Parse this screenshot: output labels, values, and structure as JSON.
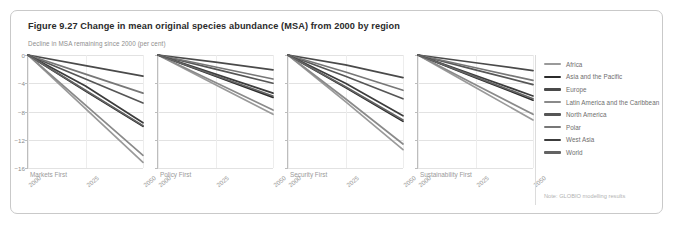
{
  "figure": {
    "title": "Figure 9.27 Change in mean original species abundance (MSA) from 2000 by region",
    "subtitle": "Decline in MSA remaining since 2000 (per cent)",
    "note": "Note: GLOBIO modelling results"
  },
  "legend": {
    "position": "right",
    "items": [
      {
        "label": "Africa",
        "color": "#9a9a9a"
      },
      {
        "label": "Asia and the Pacific",
        "color": "#2b2b2b"
      },
      {
        "label": "Europe",
        "color": "#4a4a4a"
      },
      {
        "label": "Latin America and the Caribbean",
        "color": "#8a8a8a"
      },
      {
        "label": "North America",
        "color": "#565656"
      },
      {
        "label": "Polar",
        "color": "#777777"
      },
      {
        "label": "West Asia",
        "color": "#3c3c3c"
      },
      {
        "label": "World",
        "color": "#636363"
      }
    ]
  },
  "axes": {
    "ylabel": "Decline in MSA remaining since 2000 (per cent)",
    "yticks": [
      0,
      -4,
      -8,
      -12,
      -16
    ],
    "ylim": [
      -16,
      0
    ],
    "xticks": [
      "2000",
      "2025",
      "2050"
    ],
    "xlim": [
      2000,
      2050
    ],
    "grid": true
  },
  "chart_data": {
    "type": "line",
    "title": "Figure 9.27 Change in mean original species abundance (MSA) from 2000 by region",
    "xlabel": "",
    "ylabel": "Decline in MSA remaining since 2000 (per cent)",
    "ylim": [
      -16,
      0
    ],
    "yticks": [
      0,
      -4,
      -8,
      -12,
      -16
    ],
    "x": [
      2000,
      2025,
      2050
    ],
    "xtick_labels": [
      "2000",
      "2025",
      "2050"
    ],
    "legend_position": "right",
    "note": "Note: GLOBIO modelling results",
    "panels": [
      {
        "label": "Markets First",
        "series": [
          {
            "name": "Africa",
            "color": "#9a9a9a",
            "values": [
              0,
              -7.6,
              -15.2
            ]
          },
          {
            "name": "Asia and the Pacific",
            "color": "#2b2b2b",
            "values": [
              0,
              -5.1,
              -10.1
            ]
          },
          {
            "name": "Europe",
            "color": "#4a4a4a",
            "values": [
              0,
              -1.5,
              -3.0
            ]
          },
          {
            "name": "Latin America and the Caribbean",
            "color": "#8a8a8a",
            "values": [
              0,
              -7.1,
              -14.2
            ]
          },
          {
            "name": "North America",
            "color": "#565656",
            "values": [
              0,
              -3.4,
              -6.8
            ]
          },
          {
            "name": "Polar",
            "color": "#777777",
            "values": [
              0,
              -2.7,
              -5.4
            ]
          },
          {
            "name": "West Asia",
            "color": "#3c3c3c",
            "values": [
              0,
              -4.4,
              -9.6
            ]
          },
          {
            "name": "World",
            "color": "#636363",
            "values": [
              0,
              -5.0,
              -10.0
            ]
          }
        ]
      },
      {
        "label": "Policy First",
        "series": [
          {
            "name": "Africa",
            "color": "#9a9a9a",
            "values": [
              0,
              -4.2,
              -8.4
            ]
          },
          {
            "name": "Asia and the Pacific",
            "color": "#2b2b2b",
            "values": [
              0,
              -3.0,
              -6.0
            ]
          },
          {
            "name": "Europe",
            "color": "#4a4a4a",
            "values": [
              0,
              -1.0,
              -2.1
            ]
          },
          {
            "name": "Latin America and the Caribbean",
            "color": "#8a8a8a",
            "values": [
              0,
              -3.9,
              -7.8
            ]
          },
          {
            "name": "North America",
            "color": "#565656",
            "values": [
              0,
              -2.0,
              -4.0
            ]
          },
          {
            "name": "Polar",
            "color": "#777777",
            "values": [
              0,
              -1.7,
              -3.4
            ]
          },
          {
            "name": "West Asia",
            "color": "#3c3c3c",
            "values": [
              0,
              -2.7,
              -5.4
            ]
          },
          {
            "name": "World",
            "color": "#636363",
            "values": [
              0,
              -2.9,
              -5.8
            ]
          }
        ]
      },
      {
        "label": "Security First",
        "series": [
          {
            "name": "Africa",
            "color": "#9a9a9a",
            "values": [
              0,
              -6.6,
              -13.4
            ]
          },
          {
            "name": "Asia and the Pacific",
            "color": "#2b2b2b",
            "values": [
              0,
              -4.6,
              -9.4
            ]
          },
          {
            "name": "Europe",
            "color": "#4a4a4a",
            "values": [
              0,
              -1.4,
              -3.2
            ]
          },
          {
            "name": "Latin America and the Caribbean",
            "color": "#8a8a8a",
            "values": [
              0,
              -6.2,
              -12.6
            ]
          },
          {
            "name": "North America",
            "color": "#565656",
            "values": [
              0,
              -3.0,
              -6.2
            ]
          },
          {
            "name": "Polar",
            "color": "#777777",
            "values": [
              0,
              -2.4,
              -5.0
            ]
          },
          {
            "name": "West Asia",
            "color": "#3c3c3c",
            "values": [
              0,
              -4.0,
              -8.6
            ]
          },
          {
            "name": "World",
            "color": "#636363",
            "values": [
              0,
              -4.5,
              -9.2
            ]
          }
        ]
      },
      {
        "label": "Sustainability First",
        "series": [
          {
            "name": "Africa",
            "color": "#9a9a9a",
            "values": [
              0,
              -4.6,
              -9.2
            ]
          },
          {
            "name": "Asia and the Pacific",
            "color": "#2b2b2b",
            "values": [
              0,
              -3.2,
              -6.4
            ]
          },
          {
            "name": "Europe",
            "color": "#4a4a4a",
            "values": [
              0,
              -1.1,
              -2.2
            ]
          },
          {
            "name": "Latin America and the Caribbean",
            "color": "#8a8a8a",
            "values": [
              0,
              -4.2,
              -8.4
            ]
          },
          {
            "name": "North America",
            "color": "#565656",
            "values": [
              0,
              -2.1,
              -4.2
            ]
          },
          {
            "name": "Polar",
            "color": "#777777",
            "values": [
              0,
              -1.8,
              -3.6
            ]
          },
          {
            "name": "West Asia",
            "color": "#3c3c3c",
            "values": [
              0,
              -2.9,
              -5.8
            ]
          },
          {
            "name": "World",
            "color": "#636363",
            "values": [
              0,
              -3.1,
              -6.2
            ]
          }
        ]
      }
    ]
  }
}
